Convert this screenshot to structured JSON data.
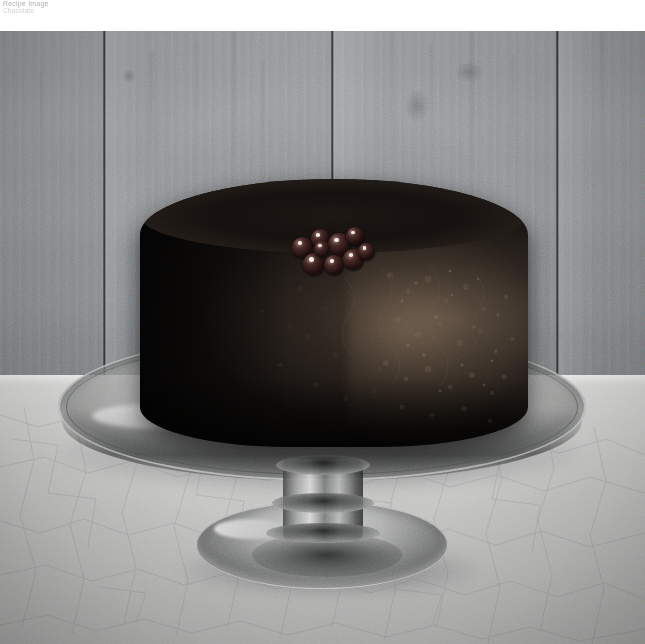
{
  "header": {
    "line1": "Recipe Image",
    "line2": "Chocolate"
  },
  "photo": {
    "alt_description": "Dark chocolate bundt cake topped with berries on a glass pedestal cake stand",
    "subject": "chocolate-cake",
    "background": "vertical wood plank wall",
    "surface": "crackle-glazed countertop",
    "colors": {
      "wall": "#93969a",
      "wall_seam": "#2a2c2e",
      "counter": "#c9c9c7",
      "cake_dark": "#0b0908",
      "cake_highlight": "#927a62",
      "glass": "#cfd1cf",
      "berry": "#2a1210"
    },
    "berries": [
      {
        "x": 6,
        "y": 10,
        "d": 21
      },
      {
        "x": 25,
        "y": 2,
        "d": 19
      },
      {
        "x": 42,
        "y": 6,
        "d": 23
      },
      {
        "x": 60,
        "y": 0,
        "d": 18
      },
      {
        "x": 17,
        "y": 26,
        "d": 22
      },
      {
        "x": 38,
        "y": 28,
        "d": 20
      },
      {
        "x": 57,
        "y": 22,
        "d": 21
      },
      {
        "x": 72,
        "y": 16,
        "d": 17
      },
      {
        "x": 28,
        "y": 14,
        "d": 16
      }
    ],
    "wall_seams": [
      102,
      330,
      555
    ],
    "cake": {
      "left": 140,
      "top": 148,
      "width": 388,
      "height": 268
    },
    "plate": {
      "left": 58,
      "top": 302,
      "width": 528,
      "height": 148
    },
    "foot": {
      "left": 196,
      "top": 470,
      "width": 252,
      "height": 88
    }
  }
}
